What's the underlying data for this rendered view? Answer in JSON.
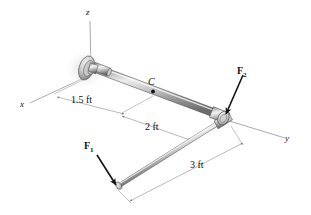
{
  "figure": {
    "axes": [
      {
        "name": "z-axis",
        "label": "z"
      },
      {
        "name": "x-axis",
        "label": "x"
      },
      {
        "name": "y-axis",
        "label": "y"
      }
    ],
    "points": [
      {
        "name": "point-c",
        "label": "C"
      }
    ],
    "forces": [
      {
        "name": "force-f1",
        "label": "F",
        "subscript": "1"
      },
      {
        "name": "force-f2",
        "label": "F",
        "subscript": "2"
      }
    ],
    "dimensions": [
      {
        "name": "dimension-1-5-ft",
        "label": "1.5 ft",
        "value": 1.5,
        "unit": "ft"
      },
      {
        "name": "dimension-2-ft",
        "label": "2 ft",
        "value": 2,
        "unit": "ft"
      },
      {
        "name": "dimension-3-ft",
        "label": "3 ft",
        "value": 3,
        "unit": "ft"
      }
    ],
    "colors": {
      "rod_light": "#e8e8e8",
      "rod_mid": "#b8b8b8",
      "rod_dark": "#6e6e6e",
      "rod_outline": "#4a4a4a",
      "dim_line": "#9a9a9a",
      "axis_line": "#9a9a9a",
      "arrow": "#1a1a1a",
      "background": "#ffffff"
    }
  }
}
